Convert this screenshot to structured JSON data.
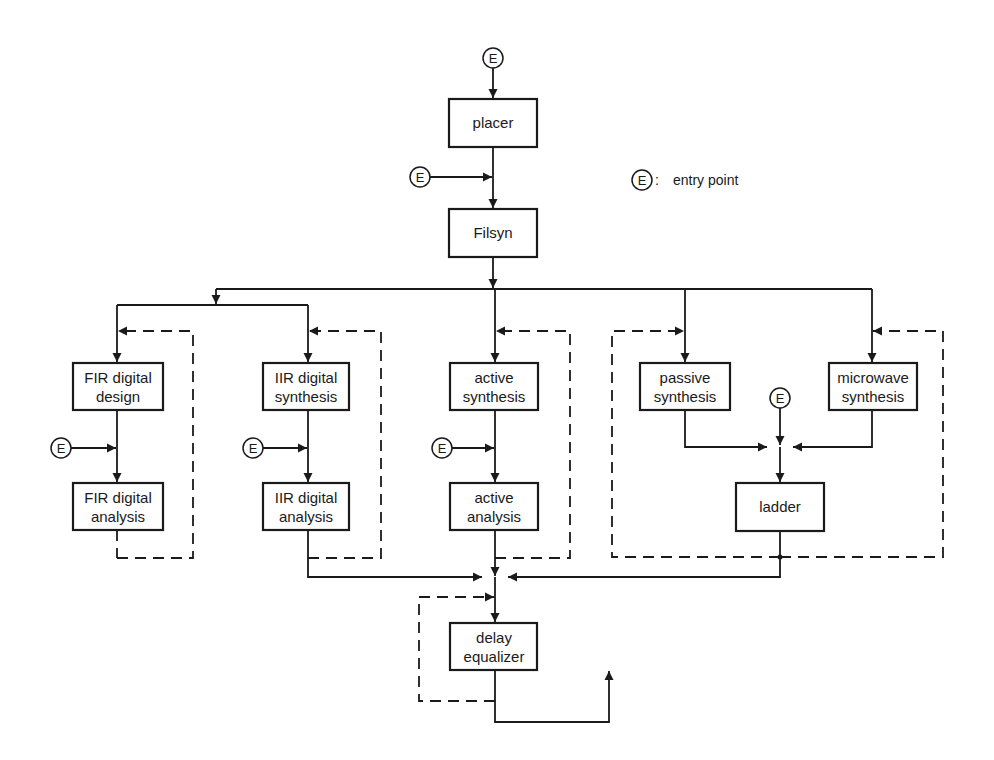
{
  "legend": {
    "symbol": "E",
    "separator": ":",
    "text": "entry point"
  },
  "entry_symbol": "E",
  "nodes": {
    "placer": {
      "lines": [
        "placer"
      ]
    },
    "filsyn": {
      "lines": [
        "Filsyn"
      ]
    },
    "fir_design": {
      "lines": [
        "FIR digital",
        "design"
      ]
    },
    "fir_analysis": {
      "lines": [
        "FIR digital",
        "analysis"
      ]
    },
    "iir_synthesis": {
      "lines": [
        "IIR digital",
        "synthesis"
      ]
    },
    "iir_analysis": {
      "lines": [
        "IIR digital",
        "analysis"
      ]
    },
    "active_synthesis": {
      "lines": [
        "active",
        "synthesis"
      ]
    },
    "active_analysis": {
      "lines": [
        "active",
        "analysis"
      ]
    },
    "passive_synthesis": {
      "lines": [
        "passive",
        "synthesis"
      ]
    },
    "microwave_synthesis": {
      "lines": [
        "microwave",
        "synthesis"
      ]
    },
    "ladder": {
      "lines": [
        "ladder"
      ]
    },
    "delay_equalizer": {
      "lines": [
        "delay",
        "equalizer"
      ]
    }
  },
  "colors": {
    "ink": "#1a1a1a",
    "background": "#ffffff"
  }
}
